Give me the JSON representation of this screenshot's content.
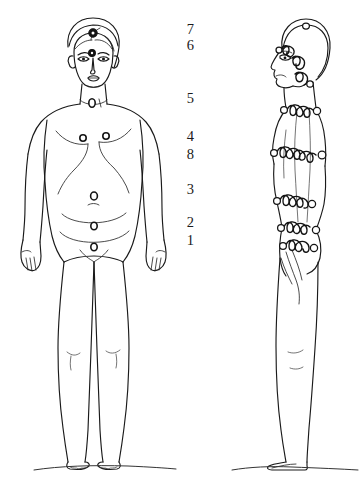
{
  "diagram": {
    "background_color": "#ffffff",
    "ink_color": "#141414",
    "width": 364,
    "height": 493
  },
  "scale": {
    "name": "chakra-number-scale",
    "description": "Vertical column of numerals marking chakra levels between the two figures",
    "numbers": [
      {
        "label": "7",
        "top": 22
      },
      {
        "label": "6",
        "top": 38
      },
      {
        "label": "5",
        "top": 91
      },
      {
        "label": "4",
        "top": 129
      },
      {
        "label": "8",
        "top": 147
      },
      {
        "label": "3",
        "top": 182
      },
      {
        "label": "2",
        "top": 215
      },
      {
        "label": "1",
        "top": 233
      }
    ]
  },
  "figures": [
    {
      "name": "front-view-figure",
      "view": "front",
      "description": "Standing nude figure seen from the front with circular chakra markers along the midline"
    },
    {
      "name": "side-view-figure",
      "view": "side",
      "description": "Standing nude figure seen from the left side with coiled energy bands and circular nodes encircling the body"
    }
  ],
  "markers": {
    "front": [
      {
        "name": "crown-chakra-marker",
        "style": "filled",
        "cx": 93,
        "cy": 33,
        "r": 4.2
      },
      {
        "name": "third-eye-chakra-marker",
        "style": "filled",
        "cx": 92,
        "cy": 53,
        "r": 3.4
      },
      {
        "name": "throat-chakra-marker",
        "style": "ring",
        "cx": 92,
        "cy": 103,
        "r": 3.6
      },
      {
        "name": "heart-chakra-marker-left",
        "style": "ring",
        "cx": 83,
        "cy": 138,
        "r": 3.2
      },
      {
        "name": "heart-chakra-marker-right",
        "style": "ring",
        "cx": 106,
        "cy": 136,
        "r": 3.2
      },
      {
        "name": "solar-plexus-chakra-marker",
        "style": "ring",
        "cx": 94,
        "cy": 196,
        "r": 3.6
      },
      {
        "name": "sacral-chakra-marker",
        "style": "ring",
        "cx": 94,
        "cy": 226,
        "r": 3.4
      },
      {
        "name": "root-chakra-marker",
        "style": "ring",
        "cx": 94,
        "cy": 247,
        "r": 3.4
      }
    ]
  },
  "ground": {
    "name": "ground-line",
    "front_y": 466,
    "side_y": 463
  }
}
